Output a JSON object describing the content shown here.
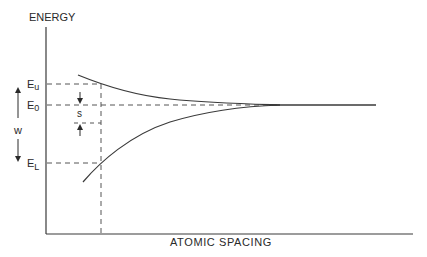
{
  "diagram": {
    "type": "energy-level-splitting",
    "y_axis_label": "ENERGY",
    "x_axis_label": "ATOMIC SPACING",
    "levels": {
      "upper": {
        "label": "E",
        "subscript": "u"
      },
      "center": {
        "label": "E",
        "subscript": "0"
      },
      "lower": {
        "label": "E",
        "subscript": "L"
      }
    },
    "dimensions": {
      "width_label": "w",
      "separation_label": "s"
    },
    "colors": {
      "line": "#3a3a3a",
      "dashed": "#555555",
      "background": "#ffffff"
    }
  }
}
